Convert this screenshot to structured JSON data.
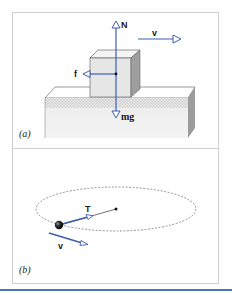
{
  "figure": {
    "panels": [
      {
        "id": "a",
        "label": "(a)",
        "description": "Block sliding on a surface with force vectors",
        "vectors": {
          "normal": "N",
          "velocity": "v",
          "friction": "f",
          "weight": "mg"
        }
      },
      {
        "id": "b",
        "label": "(b)",
        "description": "Ball on string moving in a horizontal circle",
        "vectors": {
          "tension": "T",
          "velocity": "v"
        }
      }
    ],
    "colors": {
      "vector_blue": "#3a5fb5",
      "frame_gray": "#cfcfcf",
      "bottom_rule": "#4a76b8"
    }
  }
}
